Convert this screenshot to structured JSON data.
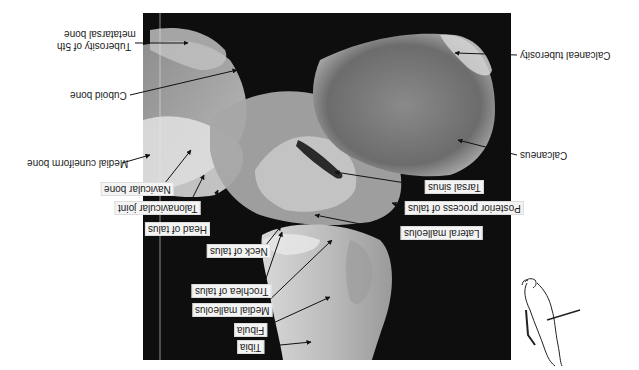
{
  "figure": {
    "orientation": "rotated 180 degrees",
    "view": "Lateral radiograph of ankle and foot",
    "frame": {
      "x": 143,
      "y": 13,
      "width": 368,
      "height": 347,
      "background": "#0e0e0e"
    },
    "labels": [
      {
        "id": "calcaneal-tuberosity",
        "text": "Calcaneal tuberosity",
        "boxed": false
      },
      {
        "id": "calcaneus",
        "text": "Calcaneus",
        "boxed": false
      },
      {
        "id": "tarsal-sinus",
        "text": "Tarsal sinus",
        "boxed": true
      },
      {
        "id": "posterior-process-of-talus",
        "text": "Posterior process of talus",
        "boxed": true
      },
      {
        "id": "lateral-malleolus",
        "text": "Lateral malleolus",
        "boxed": true
      },
      {
        "id": "tuberosity-5th-metatarsal-line1",
        "text": "Tuberosity of 5th",
        "boxed": false
      },
      {
        "id": "tuberosity-5th-metatarsal-line2",
        "text": "metatarsal bone",
        "boxed": false
      },
      {
        "id": "cuboid-bone",
        "text": "Cuboid bone",
        "boxed": false
      },
      {
        "id": "medial-cuneiform-bone",
        "text": "Medial cuneiform bone",
        "boxed": false
      },
      {
        "id": "navicular-bone",
        "text": "Navicular bone",
        "boxed": true
      },
      {
        "id": "talonavicular-joint",
        "text": "Talonavicular joint",
        "boxed": true
      },
      {
        "id": "head-of-talus",
        "text": "Head of talus",
        "boxed": true
      },
      {
        "id": "neck-of-talus",
        "text": "Neck of talus",
        "boxed": true
      },
      {
        "id": "trochlea-of-talus",
        "text": "Trochlea of talus",
        "boxed": true
      },
      {
        "id": "medial-malleolus",
        "text": "Medial malleolus",
        "boxed": true
      },
      {
        "id": "fibula",
        "text": "Fibula",
        "boxed": true
      },
      {
        "id": "tibia",
        "text": "Tibia",
        "boxed": true
      }
    ],
    "inset": {
      "description": "Foot outline with arrow indicating X-ray beam direction"
    }
  }
}
